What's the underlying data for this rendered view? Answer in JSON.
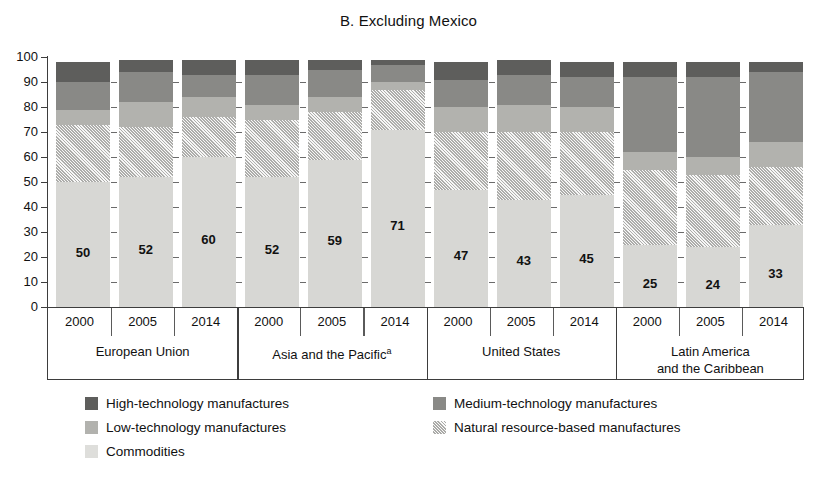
{
  "chart_data": {
    "type": "bar",
    "title": "B. Excluding Mexico",
    "xlabel": "",
    "ylabel": "",
    "ylim": [
      0,
      100
    ],
    "yticks": [
      "0",
      "10",
      "20",
      "30",
      "40",
      "50",
      "60",
      "70",
      "80",
      "90",
      "100"
    ],
    "grid": false,
    "stacked": true,
    "legend_position": "bottom",
    "categories": [
      "European Union 2000",
      "European Union 2005",
      "European Union 2014",
      "Asia and the Pacific 2000",
      "Asia and the Pacific 2005",
      "Asia and the Pacific 2014",
      "United States 2000",
      "United States 2005",
      "United States 2014",
      "Latin America and the Caribbean 2000",
      "Latin America and the Caribbean 2005",
      "Latin America and the Caribbean 2014"
    ],
    "series": [
      {
        "name": "Commodities",
        "color": "#d7d7d4",
        "values": [
          50,
          52,
          60,
          52,
          59,
          71,
          47,
          43,
          45,
          25,
          24,
          33
        ]
      },
      {
        "name": "Natural resource-based manufactures",
        "color": "#c9c9c6",
        "values": [
          23,
          20,
          16,
          23,
          19,
          16,
          23,
          27,
          25,
          30,
          29,
          23
        ]
      },
      {
        "name": "Low-technology manufactures",
        "color": "#b2b2ae",
        "values": [
          6,
          10,
          8,
          6,
          6,
          3,
          10,
          11,
          10,
          7,
          7,
          10
        ]
      },
      {
        "name": "Medium-technology manufactures",
        "color": "#898986",
        "values": [
          11,
          12,
          9,
          12,
          11,
          7,
          11,
          12,
          12,
          30,
          32,
          28
        ]
      },
      {
        "name": "High-technology manufactures",
        "color": "#5e5e5c",
        "values": [
          8,
          5,
          6,
          6,
          4,
          2,
          7,
          6,
          6,
          6,
          6,
          4
        ]
      }
    ],
    "data_labels": [
      50,
      52,
      60,
      52,
      59,
      71,
      47,
      43,
      45,
      25,
      24,
      33
    ]
  },
  "axis": {
    "y_ticks": [
      "100",
      "90",
      "80",
      "70",
      "60",
      "50",
      "40",
      "30",
      "20",
      "10",
      "0"
    ]
  },
  "groups": [
    {
      "label": "European Union",
      "label_line2": "",
      "superscript": "",
      "years": [
        "2000",
        "2005",
        "2014"
      ],
      "values": [
        50,
        52,
        60
      ]
    },
    {
      "label": "Asia and the Pacific",
      "label_line2": "",
      "superscript": "a",
      "years": [
        "2000",
        "2005",
        "2014"
      ],
      "values": [
        52,
        59,
        71
      ]
    },
    {
      "label": "United States",
      "label_line2": "",
      "superscript": "",
      "years": [
        "2000",
        "2005",
        "2014"
      ],
      "values": [
        47,
        43,
        45
      ]
    },
    {
      "label": "Latin America",
      "label_line2": "and the Caribbean",
      "superscript": "",
      "years": [
        "2000",
        "2005",
        "2014"
      ],
      "values": [
        25,
        24,
        33
      ]
    }
  ],
  "legend": {
    "items": [
      {
        "label": "High-technology manufactures",
        "swatch": "high-technology-swatch",
        "color": "#5e5e5c"
      },
      {
        "label": "Medium-technology manufactures",
        "swatch": "medium-technology-swatch",
        "color": "#898986"
      },
      {
        "label": "Low-technology manufactures",
        "swatch": "low-technology-swatch",
        "color": "#b2b2ae"
      },
      {
        "label": "Natural resource-based manufactures",
        "swatch": "natural-resource-swatch",
        "color": "#c9c9c6"
      },
      {
        "label": "Commodities",
        "swatch": "commodities-swatch",
        "color": "#dededb"
      }
    ]
  }
}
